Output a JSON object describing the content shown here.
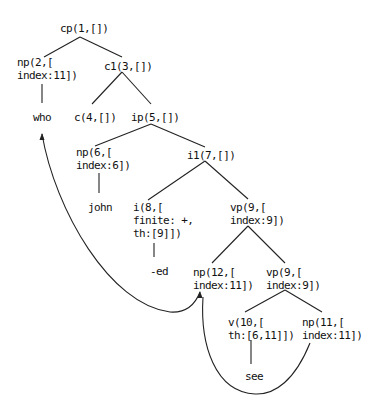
{
  "diagram": {
    "type": "syntax-tree",
    "nodes": [
      {
        "id": "cp1",
        "lines": [
          "cp(1,[])"
        ],
        "x": 60,
        "y": 22
      },
      {
        "id": "np2",
        "lines": [
          "np(2,[",
          "index:11])"
        ],
        "x": 17,
        "y": 56
      },
      {
        "id": "c1_3",
        "lines": [
          "c1(3,[])"
        ],
        "x": 104,
        "y": 60
      },
      {
        "id": "who",
        "lines": [
          "who"
        ],
        "x": 33,
        "y": 111
      },
      {
        "id": "c4",
        "lines": [
          "c(4,[])"
        ],
        "x": 74,
        "y": 111
      },
      {
        "id": "ip5",
        "lines": [
          "ip(5,[])"
        ],
        "x": 131,
        "y": 111
      },
      {
        "id": "np6",
        "lines": [
          "np(6,[",
          "index:6])"
        ],
        "x": 76,
        "y": 146
      },
      {
        "id": "i1_7",
        "lines": [
          "i1(7,[])"
        ],
        "x": 187,
        "y": 149
      },
      {
        "id": "john",
        "lines": [
          "john"
        ],
        "x": 88,
        "y": 201
      },
      {
        "id": "i8",
        "lines": [
          "i(8,[",
          "finite: +,",
          "th:[9]])"
        ],
        "x": 133,
        "y": 201
      },
      {
        "id": "vp9a",
        "lines": [
          "vp(9,[",
          "index:9])"
        ],
        "x": 230,
        "y": 201
      },
      {
        "id": "ed",
        "lines": [
          "-ed"
        ],
        "x": 150,
        "y": 265
      },
      {
        "id": "np12",
        "lines": [
          "np(12,[",
          "index:11])"
        ],
        "x": 193,
        "y": 266
      },
      {
        "id": "vp9b",
        "lines": [
          "vp(9,[",
          "index:9])"
        ],
        "x": 266,
        "y": 266
      },
      {
        "id": "v10",
        "lines": [
          "v(10,[",
          "th:[6,11]])"
        ],
        "x": 228,
        "y": 316
      },
      {
        "id": "np11",
        "lines": [
          "np(11,[",
          "index:11])"
        ],
        "x": 302,
        "y": 316
      },
      {
        "id": "see",
        "lines": [
          "see"
        ],
        "x": 245,
        "y": 370
      }
    ],
    "edges": [
      [
        80,
        37,
        44,
        57
      ],
      [
        80,
        37,
        122,
        57
      ],
      [
        42,
        84,
        42,
        103
      ],
      [
        122,
        72,
        92,
        104
      ],
      [
        122,
        72,
        151,
        104
      ],
      [
        151,
        124,
        95,
        146
      ],
      [
        151,
        124,
        205,
        147
      ],
      [
        205,
        161,
        148,
        200
      ],
      [
        205,
        161,
        248,
        199
      ],
      [
        99,
        173,
        99,
        193
      ],
      [
        154,
        243,
        154,
        257
      ],
      [
        248,
        226,
        212,
        263
      ],
      [
        248,
        226,
        285,
        263
      ],
      [
        285,
        290,
        245,
        312
      ],
      [
        285,
        290,
        322,
        312
      ],
      [
        251,
        340,
        251,
        364
      ]
    ],
    "arrows": [
      {
        "id": "movement-who",
        "path": "M 200 292 C 195 305, 185 313, 170 312 C 110 305, 55 210, 42 134",
        "heads": [
          [
            42,
            133,
            "up"
          ],
          [
            200,
            291,
            "up"
          ]
        ]
      },
      {
        "id": "movement-np12",
        "path": "M 310 343 C 295 380, 275 395, 255 394 C 215 392, 200 345, 203 297",
        "heads": []
      }
    ]
  }
}
